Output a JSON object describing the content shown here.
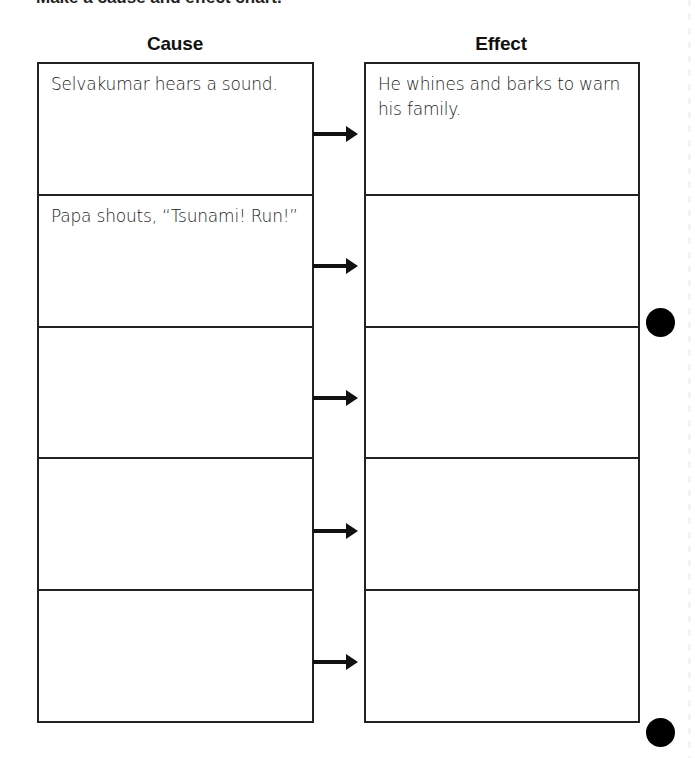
{
  "page": {
    "cut_off_title": "Make a cause and effect chart."
  },
  "headers": {
    "cause": "Cause",
    "effect": "Effect"
  },
  "rows": [
    {
      "cause": "Selvakumar hears a sound.",
      "effect": "He whines and barks to warn his family."
    },
    {
      "cause": "Papa shouts, “Tsunami! Run!”",
      "effect": ""
    },
    {
      "cause": "",
      "effect": ""
    },
    {
      "cause": "",
      "effect": ""
    },
    {
      "cause": "",
      "effect": ""
    }
  ],
  "arrows": {
    "icon": "right-arrow-icon",
    "count": 5
  },
  "decorations": {
    "punch_holes": 2,
    "line_color": "#222222",
    "hole_color": "#000000"
  }
}
